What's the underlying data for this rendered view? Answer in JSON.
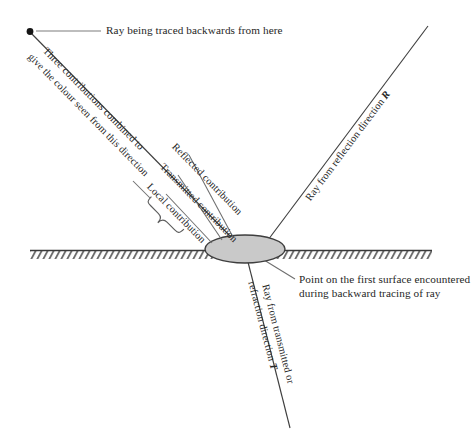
{
  "figure": {
    "type": "ray-tracing-diagram",
    "background_color": "#ffffff",
    "ink_color": "#262626",
    "surface_fill": "#c8c8c8",
    "surface_stroke": "#4a4a4a"
  },
  "labels": {
    "eye_ray": "Ray being traced backwards from here",
    "combine_line1": "Three contributions combined to",
    "combine_line2": "give the colour seen from this direction",
    "reflected": "Reflected contribution",
    "transmitted": "Transmitted contribution",
    "local": "Local contribution",
    "reflection_ray_text": "Ray from reflection direction",
    "reflection_vector": "R",
    "transmitted_ray_line1": "Ray from transmitted or",
    "transmitted_ray_line2a": "refraction direction",
    "transmitted_vector": "T",
    "hit_point_line1": "Point on the first surface encountered",
    "hit_point_line2": "during backward tracing of ray"
  },
  "geometry": {
    "eye_point": {
      "x": 30,
      "y": 32
    },
    "hit_point": {
      "x": 245,
      "y": 249
    },
    "reflection_ray_end": {
      "x": 428,
      "y": 26
    },
    "transmitted_ray_end": {
      "x": 290,
      "y": 428
    },
    "surface_left": 30,
    "surface_right": 432,
    "surface_y": 250,
    "ellipse": {
      "cx": 245,
      "cy": 249,
      "rx": 40,
      "ry": 14
    }
  },
  "icons": {
    "eye_dot": "filled-dot",
    "brace": "curly-brace",
    "hatching": "surface-hatch"
  }
}
